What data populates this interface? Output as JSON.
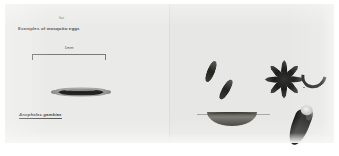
{
  "plate": {
    "title": "Examples of mosquito eggs",
    "scalebar": {
      "label": "1mm"
    },
    "left_panel": {
      "species_caption": "Anopheles gambiae",
      "egg_marker": "float"
    },
    "right_panel": {
      "specimens": [
        {
          "name": "spindle-egg-upper",
          "form": "elongate spindle egg"
        },
        {
          "name": "spindle-egg-lower",
          "form": "elongate spindle egg"
        },
        {
          "name": "egg-rosette",
          "form": "radiating rosette cluster",
          "ray_count": 8
        },
        {
          "name": "curved-egg",
          "form": "detached curved egg"
        },
        {
          "name": "egg-raft",
          "form": "boat-shaped egg raft on water surface"
        },
        {
          "name": "capped-egg",
          "form": "dark egg with pale apical cap"
        }
      ]
    }
  }
}
